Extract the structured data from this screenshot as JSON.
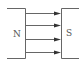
{
  "diagram": {
    "left_pole": {
      "label": "N"
    },
    "right_pole": {
      "label": "S"
    },
    "field_lines": [
      {
        "y": 13,
        "direction": "left-to-right"
      },
      {
        "y": 25,
        "direction": "left-to-right"
      },
      {
        "y": 39,
        "direction": "left-to-right"
      },
      {
        "y": 52,
        "direction": "left-to-right"
      }
    ],
    "colors": {
      "line": "#666666",
      "arrowhead": "#333333",
      "text": "#555555"
    }
  }
}
